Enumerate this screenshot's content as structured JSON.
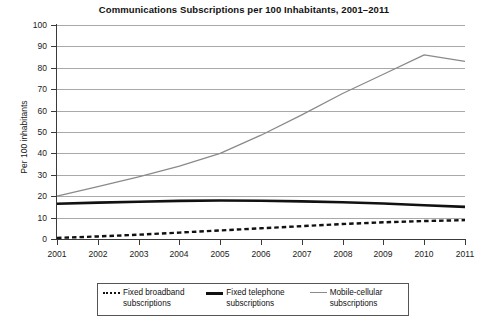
{
  "chart_data": {
    "type": "line",
    "title": "Communications Subscriptions per 100 Inhabitants, 2001–2011",
    "xlabel": "",
    "ylabel": "Per 100 inhabitants",
    "x": [
      2001,
      2002,
      2003,
      2004,
      2005,
      2006,
      2007,
      2008,
      2009,
      2010,
      2011
    ],
    "categories": [
      "2001",
      "2002",
      "2003",
      "2004",
      "2005",
      "2006",
      "2007",
      "2008",
      "2009",
      "2010",
      "2011"
    ],
    "xlim": [
      2001,
      2011
    ],
    "ylim": [
      0,
      100
    ],
    "yticks": [
      0,
      10,
      20,
      30,
      40,
      50,
      60,
      70,
      80,
      90,
      100
    ],
    "ytick_labels": [
      "0",
      "10",
      "20",
      "30",
      "40",
      "50",
      "60",
      "70",
      "80",
      "90",
      "100"
    ],
    "grid": "horizontal",
    "legend_position": "bottom",
    "series": [
      {
        "name": "Fixed broadband subscriptions",
        "style": "dotted",
        "color": "#111111",
        "values": [
          0.5,
          1.2,
          2.0,
          3.0,
          4.0,
          5.0,
          6.0,
          7.0,
          7.8,
          8.4,
          8.8
        ]
      },
      {
        "name": "Fixed telephone subscriptions",
        "style": "solid-thick",
        "color": "#111111",
        "values": [
          16.5,
          17.0,
          17.4,
          17.8,
          18.0,
          17.9,
          17.6,
          17.2,
          16.6,
          15.8,
          15.0
        ]
      },
      {
        "name": "Mobile-cellular subscriptions",
        "style": "solid-thin",
        "color": "#8a8a8a",
        "values": [
          20.0,
          24.5,
          29.0,
          34.0,
          40.0,
          48.5,
          58.0,
          68.0,
          77.0,
          86.0,
          83.0
        ]
      }
    ]
  },
  "chart": {
    "title": "Communications Subscriptions per 100 Inhabitants, 2001–2011",
    "y_axis_title": "Per 100 inhabitants"
  },
  "legend": {
    "entries": [
      {
        "label": "Fixed broadband subscriptions",
        "swatch": "dotted-line-icon"
      },
      {
        "label": "Fixed telephone subscriptions",
        "swatch": "thick-solid-line-icon"
      },
      {
        "label": "Mobile-cellular subscriptions",
        "swatch": "thin-solid-line-icon"
      }
    ]
  }
}
